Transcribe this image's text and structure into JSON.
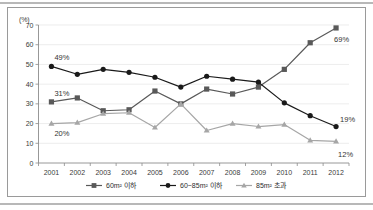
{
  "chart_data": {
    "type": "line",
    "title": "",
    "xlabel": "",
    "ylabel": "(%)",
    "ylim": [
      0,
      70
    ],
    "ytick_step": 10,
    "grid": true,
    "legend_position": "bottom",
    "categories": [
      "2001",
      "2002",
      "2003",
      "2004",
      "2005",
      "2006",
      "2007",
      "2008",
      "2009",
      "2010",
      "2011",
      "2012"
    ],
    "series": [
      {
        "name": "60m² 이하",
        "color": "#595959",
        "marker": "square",
        "values": [
          31,
          33,
          26.5,
          27,
          36.5,
          30,
          37.5,
          35,
          38.5,
          47.5,
          61,
          68.5
        ],
        "start_label": "31%",
        "end_label": "69%"
      },
      {
        "name": "60~85m² 이하",
        "color": "#1a1a1a",
        "marker": "circle",
        "values": [
          49,
          45,
          47.5,
          46,
          43.5,
          38.5,
          44,
          42.5,
          41,
          30.5,
          24,
          18.5
        ],
        "start_label": "49%",
        "end_label": "19%"
      },
      {
        "name": "85m² 초과",
        "color": "#a6a6a6",
        "marker": "triangle",
        "values": [
          20,
          20.5,
          25,
          25.5,
          18,
          30,
          16.5,
          20,
          18.5,
          19.5,
          11.5,
          11
        ],
        "start_label": "20%",
        "end_label": "12%"
      }
    ],
    "yticks": [
      "0",
      "10",
      "20",
      "30",
      "40",
      "50",
      "60",
      "70"
    ],
    "annotations": [
      {
        "text": "49%",
        "series": "60~85m² 이하",
        "at": "2001"
      },
      {
        "text": "31%",
        "series": "60m² 이하",
        "at": "2001"
      },
      {
        "text": "20%",
        "series": "85m² 초과",
        "at": "2001"
      },
      {
        "text": "69%",
        "series": "60m² 이하",
        "at": "2012"
      },
      {
        "text": "19%",
        "series": "60~85m² 이하",
        "at": "2012"
      },
      {
        "text": "12%",
        "series": "85m² 초과",
        "at": "2012"
      }
    ]
  },
  "axis": {
    "unit_label": "(%)"
  },
  "legend": {
    "items": [
      {
        "label": "60m² 이하",
        "color": "#595959",
        "marker": "square"
      },
      {
        "label": "60~85m² 이하",
        "color": "#1a1a1a",
        "marker": "circle"
      },
      {
        "label": "85m² 초과",
        "color": "#a6a6a6",
        "marker": "triangle"
      }
    ]
  }
}
